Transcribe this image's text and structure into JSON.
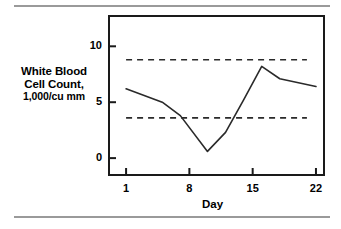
{
  "figure": {
    "rule_color": "#9a9a9a",
    "frame_color": "#1a1a1a",
    "series_color": "#2a2a2a"
  },
  "chart_data": {
    "type": "line",
    "title": "",
    "xlabel": "Day",
    "ylabel": "White Blood Cell Count, 1,000/cu mm",
    "ylabel_lines": [
      "White Blood",
      "Cell Count,",
      "1,000/cu mm"
    ],
    "xlim": [
      -1,
      23
    ],
    "ylim": [
      -1.6,
      12.8
    ],
    "xticks": [
      1,
      8,
      15,
      22
    ],
    "xtick_labels": [
      "1",
      "8",
      "15",
      "22"
    ],
    "yticks": [
      0,
      5,
      10
    ],
    "ytick_labels": [
      "0",
      "5",
      "10"
    ],
    "grid": false,
    "legend": "none",
    "series": [
      {
        "name": "White blood cell count",
        "style": "solid",
        "x": [
          1,
          5,
          7,
          10,
          12,
          14,
          16,
          18,
          22
        ],
        "values": [
          6.2,
          5.0,
          3.8,
          0.6,
          2.3,
          5.2,
          8.2,
          7.1,
          6.4
        ]
      }
    ],
    "reference_lines": [
      {
        "name": "upper reference limit",
        "style": "dashed",
        "y": 8.8,
        "x_start": 1,
        "x_end": 21
      },
      {
        "name": "lower reference limit",
        "style": "dashed",
        "y": 3.6,
        "x_start": 1,
        "x_end": 21
      }
    ]
  }
}
